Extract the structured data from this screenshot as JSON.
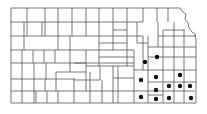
{
  "map": {
    "region": "Kansas counties",
    "background": "#ffffff",
    "line_color": "#555555",
    "dot_color": "#111111",
    "dots": [
      {
        "x": 145,
        "y": 62
      },
      {
        "x": 157,
        "y": 57
      },
      {
        "x": 141,
        "y": 80
      },
      {
        "x": 156,
        "y": 77
      },
      {
        "x": 156,
        "y": 90
      },
      {
        "x": 141,
        "y": 97
      },
      {
        "x": 156,
        "y": 99
      },
      {
        "x": 180,
        "y": 75
      },
      {
        "x": 169,
        "y": 86
      },
      {
        "x": 180,
        "y": 86
      },
      {
        "x": 190,
        "y": 86
      },
      {
        "x": 169,
        "y": 98
      },
      {
        "x": 191,
        "y": 98
      }
    ]
  }
}
